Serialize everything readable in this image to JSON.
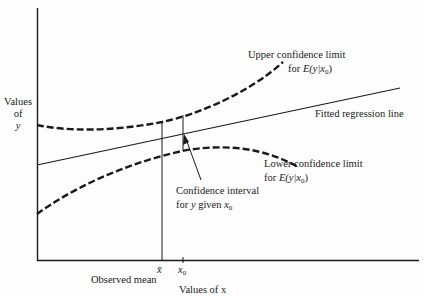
{
  "diagram": {
    "type": "regression confidence interval illustration",
    "axes": {
      "y_label_lines": [
        "Values",
        "of",
        "y"
      ],
      "x_label": "Values of x"
    },
    "x_ticks": {
      "mean_symbol": "x̄",
      "mean_label": "Observed mean",
      "x0_symbol": "x",
      "x0_sub": "0"
    },
    "annotations": {
      "upper_line1": "Upper confidence limit",
      "upper_line2_prefix": "for ",
      "upper_line2_expr": "E(y|x",
      "upper_line2_sub": "0",
      "upper_line2_close": ")",
      "fitted": "Fitted regression line",
      "lower_line1": "Lower confidence limit",
      "lower_line2_prefix": "for ",
      "lower_line2_expr": "E(y|x",
      "lower_line2_sub": "0",
      "lower_line2_close": ")",
      "ci_line1": "Confidence interval",
      "ci_line2_prefix": "for ",
      "ci_line2_y": "y",
      "ci_line2_mid": " given ",
      "ci_line2_x": "x",
      "ci_line2_sub": "0"
    },
    "colors": {
      "ink": "#1a1a1a",
      "background": "#fdfdfd"
    }
  }
}
